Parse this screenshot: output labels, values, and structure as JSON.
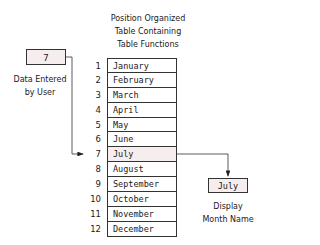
{
  "title": [
    "Position Organized",
    "Table Containing",
    "Table Functions"
  ],
  "input": {
    "value": "7",
    "label": [
      "Data Entered",
      "by User"
    ]
  },
  "table": {
    "rows": [
      {
        "index": "1",
        "month": "January"
      },
      {
        "index": "2",
        "month": "February"
      },
      {
        "index": "3",
        "month": "March"
      },
      {
        "index": "4",
        "month": "April"
      },
      {
        "index": "5",
        "month": "May"
      },
      {
        "index": "6",
        "month": "June"
      },
      {
        "index": "7",
        "month": "July"
      },
      {
        "index": "8",
        "month": "August"
      },
      {
        "index": "9",
        "month": "September"
      },
      {
        "index": "10",
        "month": "October"
      },
      {
        "index": "11",
        "month": "November"
      },
      {
        "index": "12",
        "month": "December"
      }
    ],
    "highlight_index": 6
  },
  "output": {
    "value": "July",
    "label": [
      "Display",
      "Month Name"
    ]
  },
  "colors": {
    "highlight": "#f6eeee",
    "stroke": "#333333"
  }
}
